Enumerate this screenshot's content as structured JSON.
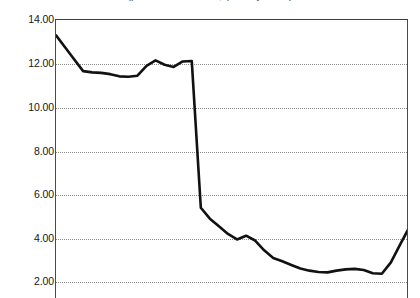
{
  "figure": {
    "title": "(percent of total loans, quarterly series)",
    "title_cropped": true,
    "background": "#ffffff",
    "line_color": "#111111",
    "grid_color": "#8b8b8b",
    "axis_color": "#4a4a4a"
  },
  "axis": {
    "y_ticks": [
      "14.00",
      "12.00",
      "10.00",
      "8.00",
      "6.00",
      "4.00",
      "2.00"
    ],
    "y_values": [
      14,
      12,
      10,
      8,
      6,
      4,
      2
    ],
    "y_min": 2.0,
    "y_max": 14.0,
    "x_ticks": [],
    "x_labels_visible": false
  },
  "chart_data": {
    "type": "line",
    "title": "(percent of total loans, quarterly series)",
    "xlabel": "",
    "ylabel": "",
    "ylim": [
      2.0,
      14.0
    ],
    "xlim": [
      0,
      39
    ],
    "grid": true,
    "grid_axis": "y",
    "legend": "none",
    "x": [
      0,
      1,
      2,
      3,
      4,
      5,
      6,
      7,
      8,
      9,
      10,
      11,
      12,
      13,
      14,
      15,
      16,
      17,
      18,
      19,
      20,
      21,
      22,
      23,
      24,
      25,
      26,
      27,
      28,
      29,
      30,
      31,
      32,
      33,
      34,
      35,
      36,
      37,
      38,
      39
    ],
    "series": [
      {
        "name": "ratio",
        "color": "#111111",
        "values": [
          13.3,
          12.75,
          12.2,
          11.66,
          11.6,
          11.58,
          11.52,
          11.42,
          11.4,
          11.45,
          11.9,
          12.15,
          11.95,
          11.85,
          12.1,
          12.12,
          5.4,
          4.9,
          4.55,
          4.2,
          3.95,
          4.12,
          3.9,
          3.45,
          3.1,
          2.95,
          2.78,
          2.62,
          2.52,
          2.46,
          2.44,
          2.52,
          2.58,
          2.6,
          2.55,
          2.4,
          2.38,
          2.9,
          3.7,
          4.48
        ]
      }
    ]
  }
}
